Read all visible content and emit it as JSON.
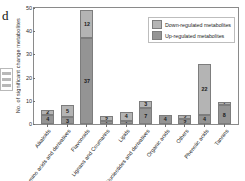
{
  "panel": {
    "letter": "d"
  },
  "legend": {
    "entries": [
      {
        "label": "Down-regulated metabolites",
        "color": "#b4b4b4",
        "key": "down"
      },
      {
        "label": "Up-regulated metabolites",
        "color": "#949494",
        "key": "up"
      }
    ]
  },
  "axes": {
    "ylabel": "No. of significant change metabolites",
    "yticks": [
      "0",
      "10",
      "20",
      "30",
      "40",
      "50"
    ]
  },
  "chart_data": {
    "type": "bar",
    "title": "",
    "xlabel": "",
    "ylabel": "No. of significant change metabolites",
    "ylim": [
      0,
      50
    ],
    "yticks": [
      0,
      10,
      20,
      30,
      40,
      50
    ],
    "grid": false,
    "stacked": true,
    "legend_position": "top-right",
    "categories": [
      "Alkaloids",
      "Amino acids and derivatives",
      "Flavonoids",
      "Lignans and Coumarins",
      "Lipids",
      "Nucleotides and derivatives",
      "Organic acids",
      "Others",
      "Phenolic acids",
      "Tannins"
    ],
    "series": [
      {
        "name": "Down-regulated metabolites",
        "color": "#b4b4b4",
        "values": [
          2,
          5,
          12,
          2,
          4,
          3,
          0,
          2,
          22,
          1
        ]
      },
      {
        "name": "Up-regulated metabolites",
        "color": "#949494",
        "values": [
          4,
          3,
          37,
          1,
          1,
          7,
          4,
          2,
          4,
          8
        ]
      }
    ],
    "totals": [
      6,
      8,
      49,
      3,
      5,
      10,
      4,
      4,
      26,
      9
    ]
  }
}
